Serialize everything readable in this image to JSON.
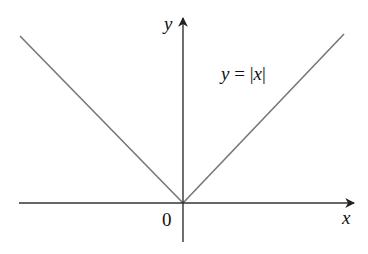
{
  "figure": {
    "type": "function_graph",
    "function_label": "y = |x|",
    "function_label_parts": {
      "lhs": "y",
      "eq": " = ",
      "bar_left": "|",
      "var": "x",
      "bar_right": "|"
    },
    "axes": {
      "x_label": "x",
      "y_label": "y",
      "origin_label": "0"
    },
    "colors": {
      "axis": "#222222",
      "curve": "#777777",
      "text": "#111111",
      "background": "#ffffff"
    }
  }
}
